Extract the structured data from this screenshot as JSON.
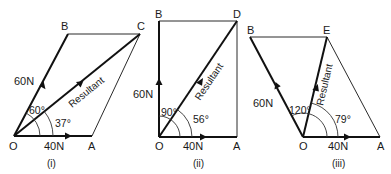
{
  "figures": [
    {
      "caption": "(i)",
      "points": {
        "O": "O",
        "A": "A",
        "B": "B",
        "C": "C"
      },
      "force_1": "40N",
      "force_2": "60N",
      "angle_between": "60°",
      "resultant_angle": "37°",
      "resultant_label": "Resultant"
    },
    {
      "caption": "(ii)",
      "points": {
        "O": "O",
        "A": "A",
        "B": "B",
        "D": "D"
      },
      "force_1": "40N",
      "force_2": "60N",
      "angle_between": "90°",
      "resultant_angle": "56°",
      "resultant_label": "Resultant"
    },
    {
      "caption": "(iii)",
      "points": {
        "O": "O",
        "A": "A",
        "B": "B",
        "E": "E"
      },
      "force_1": "40N",
      "force_2": "60N",
      "angle_between": "120°",
      "resultant_angle": "79°",
      "resultant_label": "Resultant"
    }
  ]
}
